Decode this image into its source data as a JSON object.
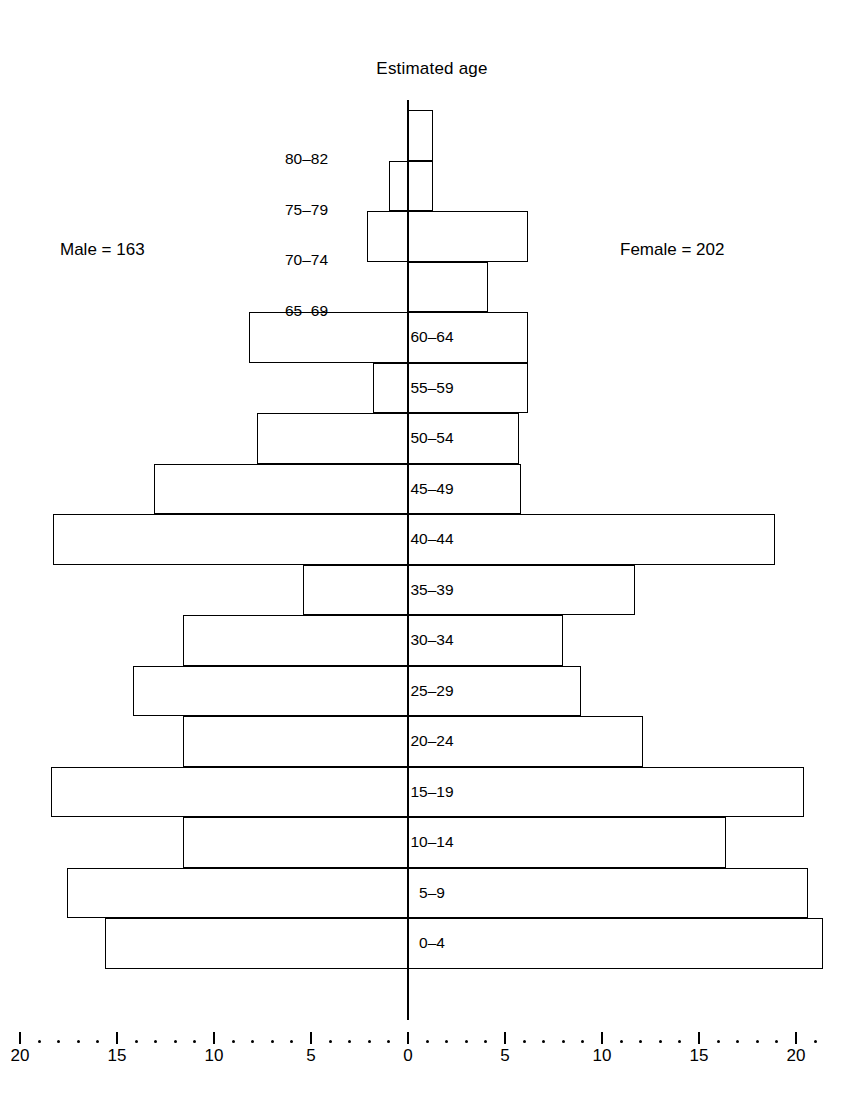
{
  "chart_data": {
    "type": "bar",
    "subtype": "population-pyramid",
    "title": "Estimated age",
    "xlabel": "",
    "ylabel": "",
    "grid": false,
    "legend_position": "none",
    "orientation": "horizontal-diverging",
    "xlim": [
      -22,
      22
    ],
    "x_axis_ticks_major": [
      20,
      15,
      10,
      5,
      0,
      5,
      10,
      15,
      20
    ],
    "x_axis_tick_labels": [
      "20",
      "15",
      "10",
      "5",
      "0",
      "5",
      "10",
      "15",
      "20"
    ],
    "x_axis_minor_tick_interval": 1,
    "categories": [
      "80–82",
      "75–79",
      "70–74",
      "65–69",
      "60–64",
      "55–59",
      "50–54",
      "45–49",
      "40–44",
      "35–39",
      "30–34",
      "25–29",
      "20–24",
      "15–19",
      "10–14",
      "5–9",
      "0–4"
    ],
    "series": [
      {
        "name": "Male",
        "side": "left",
        "total": 163,
        "total_label": "Male  =  163",
        "values": [
          0,
          1.0,
          2.1,
          0,
          8.2,
          1.8,
          7.8,
          13.1,
          18.3,
          5.4,
          11.6,
          14.2,
          11.6,
          18.4,
          11.6,
          17.6,
          15.6
        ]
      },
      {
        "name": "Female",
        "side": "right",
        "total": 202,
        "total_label": "Female  =  202",
        "values": [
          1.3,
          1.3,
          6.2,
          4.1,
          6.2,
          6.2,
          5.7,
          5.8,
          18.9,
          11.7,
          8.0,
          8.9,
          12.1,
          20.4,
          16.4,
          20.6,
          21.4
        ]
      }
    ],
    "annotations": [
      {
        "text": "Male  =  163",
        "position": "upper-left"
      },
      {
        "text": "Female  =  202",
        "position": "upper-right"
      }
    ],
    "labels_outside_bar": [
      "80–82",
      "75–79",
      "70–74",
      "65–69"
    ]
  },
  "axis": {
    "ticks": [
      {
        "label": "20",
        "value": -20
      },
      {
        "label": "15",
        "value": -15
      },
      {
        "label": "10",
        "value": -10
      },
      {
        "label": "5",
        "value": -5
      },
      {
        "label": "0",
        "value": 0
      },
      {
        "label": "5",
        "value": 5
      },
      {
        "label": "10",
        "value": 10
      },
      {
        "label": "15",
        "value": 15
      },
      {
        "label": "20",
        "value": 20
      }
    ]
  }
}
